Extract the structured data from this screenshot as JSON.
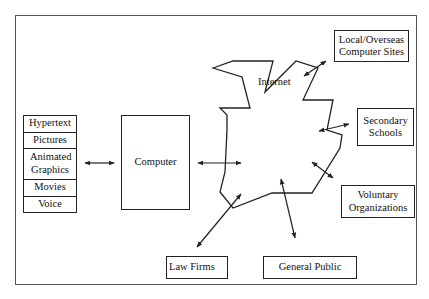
{
  "media_stack": {
    "items": [
      "Hypertext",
      "Pictures",
      "Animated Graphics",
      "Movies",
      "Voice"
    ]
  },
  "computer": {
    "label": "Computer"
  },
  "internet": {
    "label": "Internet"
  },
  "nodes": {
    "local_overseas": "Local/Overseas Computer Sites",
    "secondary_schools": "Secondary Schools",
    "voluntary_organizations": "Voluntary Organizations",
    "law_firms": "Law Firms",
    "general_public": "General Public"
  },
  "connections": [
    {
      "from": "media_stack",
      "to": "computer",
      "type": "bidirectional"
    },
    {
      "from": "computer",
      "to": "internet",
      "type": "bidirectional"
    },
    {
      "from": "internet",
      "to": "local_overseas",
      "type": "bidirectional"
    },
    {
      "from": "internet",
      "to": "secondary_schools",
      "type": "bidirectional"
    },
    {
      "from": "internet",
      "to": "voluntary_organizations",
      "type": "bidirectional"
    },
    {
      "from": "internet",
      "to": "law_firms",
      "type": "bidirectional"
    },
    {
      "from": "internet",
      "to": "general_public",
      "type": "bidirectional"
    }
  ],
  "colors": {
    "stroke": "#222222",
    "frame": "#555555",
    "background": "#ffffff"
  }
}
